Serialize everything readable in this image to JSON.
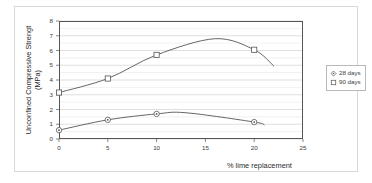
{
  "chart_data": {
    "type": "line",
    "title": "",
    "xlabel": "% lime replacement",
    "ylabel": "Unconfined Compressive Strengt (MPa)",
    "ylabel_line1": "Unconfined Compressive Strengt",
    "ylabel_line2": "(MPa)",
    "xlim": [
      0,
      25
    ],
    "ylim": [
      0,
      8
    ],
    "xticks": [
      0,
      5,
      10,
      15,
      20,
      25
    ],
    "yticks": [
      0,
      1,
      2,
      3,
      4,
      5,
      6,
      7,
      8
    ],
    "grid": "horizontal-major-and-minor",
    "minor_y_step": 0.5,
    "legend_position": "right",
    "series": [
      {
        "name": "28 days",
        "marker": "diamond",
        "color": "#555555",
        "x": [
          0,
          5,
          10,
          20
        ],
        "values": [
          0.6,
          1.3,
          1.7,
          1.15
        ],
        "curve_peak_x": 13,
        "curve_peak_y": 1.78,
        "curve_end_x": 21,
        "curve_end_y": 0.95
      },
      {
        "name": "90 days",
        "marker": "square",
        "color": "#555555",
        "x": [
          0,
          5,
          10,
          20
        ],
        "values": [
          3.15,
          4.1,
          5.7,
          6.05
        ],
        "curve_peak_x": 16,
        "curve_peak_y": 6.8,
        "curve_end_x": 22,
        "curve_end_y": 4.95
      }
    ]
  },
  "axes": {
    "x_tick_labels": [
      "0",
      "5",
      "10",
      "15",
      "20",
      "25"
    ],
    "y_tick_labels": [
      "0",
      "1",
      "2",
      "3",
      "4",
      "5",
      "6",
      "7",
      "8"
    ],
    "x_axis_title": "% lime replacement",
    "y_axis_title_line1": "Unconfined Compressive Strengt",
    "y_axis_title_line2": "(MPa)"
  },
  "legend": {
    "items": [
      {
        "label": "28 days",
        "marker": "diamond-marker"
      },
      {
        "label": "90 days",
        "marker": "square-marker"
      }
    ]
  }
}
